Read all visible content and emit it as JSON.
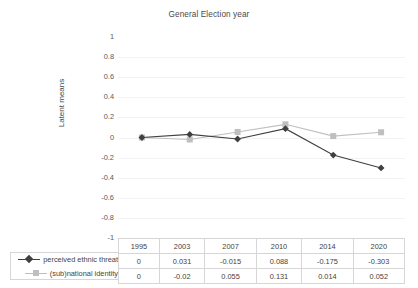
{
  "chart_data": {
    "type": "line",
    "title": "General Election year",
    "xlabel": "",
    "ylabel": "Latent means",
    "categories": [
      "1995",
      "2003",
      "2007",
      "2010",
      "2014",
      "2020"
    ],
    "series": [
      {
        "name": "perceived ethnic threat",
        "values": [
          0,
          0.031,
          -0.015,
          0.088,
          -0.175,
          -0.303
        ],
        "value_labels": [
          "0",
          "0.031",
          "-0.015",
          "0.088",
          "-0.175",
          "-0.303"
        ],
        "color": "#404040",
        "marker": "diamond"
      },
      {
        "name": "(sub)national identity",
        "values": [
          0,
          -0.02,
          0.055,
          0.131,
          0.014,
          0.052
        ],
        "value_labels": [
          "0",
          "-0.02",
          "0.055",
          "0.131",
          "0.014",
          "0.052"
        ],
        "color": "#bfbfbf",
        "marker": "square"
      }
    ],
    "ylim": [
      -1,
      1
    ],
    "yticks": [
      1,
      0.8,
      0.6,
      0.4,
      0.2,
      0,
      -0.2,
      -0.4,
      -0.6,
      -0.8,
      -1
    ],
    "ytick_labels": [
      "1",
      "0.8",
      "0.6",
      "0.4",
      "0.2",
      "0",
      "-0.2",
      "-0.4",
      "-0.6",
      "-0.8",
      "-1"
    ],
    "grid": true,
    "legend_position": "left-of-data-table",
    "data_table_visible": true
  },
  "colors": {
    "series1": "#404040",
    "series2": "#bfbfbf",
    "gridline": "#f2f2f2",
    "table_border": "#d6d6d6",
    "text": "#3f3f3f"
  }
}
